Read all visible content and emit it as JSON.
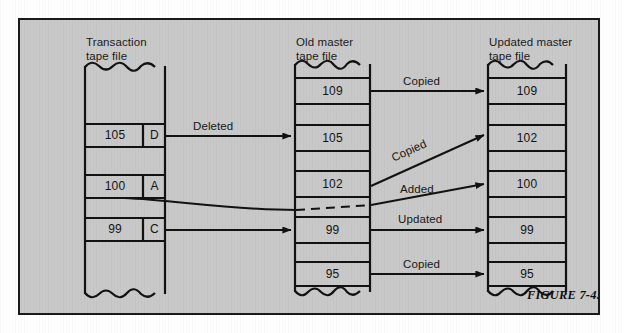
{
  "figure": {
    "caption": "FIGURE 7-4.",
    "background_color": "#c9c9c9",
    "border_color": "#1b1b1b"
  },
  "columns": {
    "transaction": {
      "title": "Transaction\ntape file",
      "records": [
        {
          "key": "105",
          "code": "D"
        },
        {
          "key": "100",
          "code": "A"
        },
        {
          "key": "99",
          "code": "C"
        }
      ]
    },
    "old_master": {
      "title": "Old master\ntape file",
      "records": [
        "109",
        "105",
        "102",
        "99",
        "95"
      ]
    },
    "updated_master": {
      "title": "Updated master\ntape file",
      "records": [
        "109",
        "102",
        "100",
        "99",
        "95"
      ]
    }
  },
  "arrows": [
    {
      "label": "Deleted",
      "from": "transaction-105-D",
      "to": "old-105"
    },
    {
      "label": "Copied",
      "from": "old-109",
      "to": "new-109"
    },
    {
      "label": "Copied",
      "from": "old-102",
      "to": "new-102"
    },
    {
      "label": "Added",
      "from": "transaction-100-A",
      "to": "new-100"
    },
    {
      "label": "Updated",
      "from": "transaction-99-C",
      "to": "old-99",
      "continues_to": "new-99"
    },
    {
      "label": "Copied",
      "from": "old-95",
      "to": "new-95"
    }
  ]
}
